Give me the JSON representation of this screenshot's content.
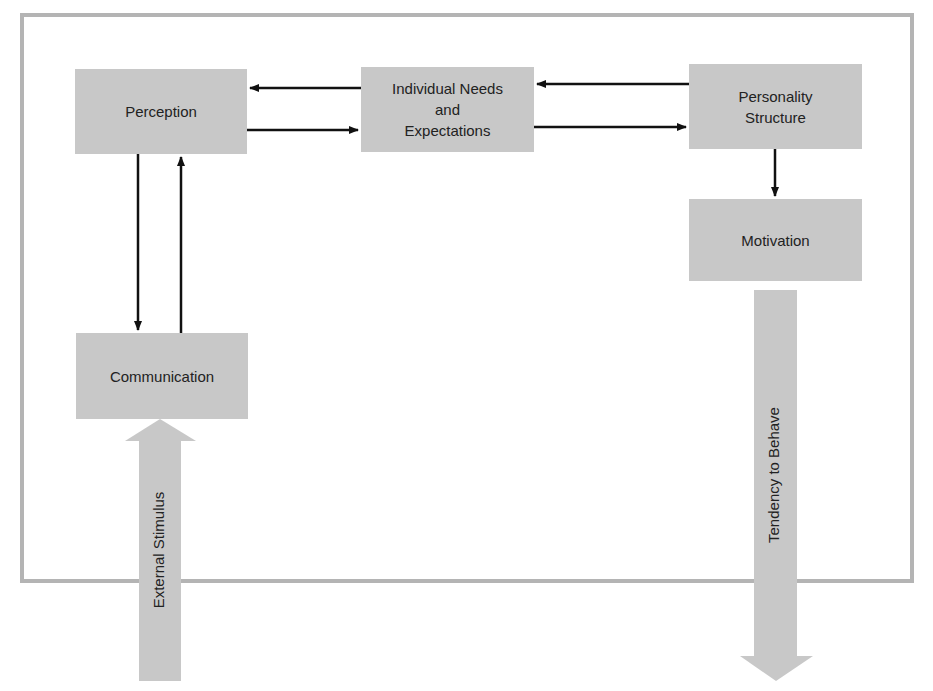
{
  "diagram": {
    "nodes": {
      "perception": {
        "label": "Perception"
      },
      "needs": {
        "label": "Individual Needs\nand\nExpectations"
      },
      "personality": {
        "label": "Personality\nStructure"
      },
      "motivation": {
        "label": "Motivation"
      },
      "communication": {
        "label": "Communication"
      }
    },
    "flows": {
      "input": {
        "label": "External Stimulus"
      },
      "output": {
        "label": "Tendency to Behave"
      }
    },
    "edges": [
      {
        "from": "needs",
        "to": "perception"
      },
      {
        "from": "perception",
        "to": "needs"
      },
      {
        "from": "personality",
        "to": "needs"
      },
      {
        "from": "needs",
        "to": "personality"
      },
      {
        "from": "personality",
        "to": "motivation"
      },
      {
        "from": "perception",
        "to": "communication"
      },
      {
        "from": "communication",
        "to": "perception"
      },
      {
        "from": "external-stimulus",
        "to": "communication"
      },
      {
        "from": "motivation",
        "to": "tendency-to-behave"
      }
    ],
    "colors": {
      "box": "#c8c8c8",
      "frame": "#b4b4b4",
      "arrow": "#111111",
      "text": "#222222"
    }
  }
}
